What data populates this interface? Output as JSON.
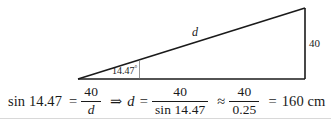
{
  "figure": {
    "type": "right-triangle-diagram",
    "hypotenuse_label": "d",
    "opposite_side_label": "40",
    "angle_label": "14.47",
    "angle_degree_symbol": "°",
    "stroke_color": "#1a1a1a",
    "background_color": "#ffffff",
    "vertices": {
      "left": [
        78,
        79
      ],
      "top_right": [
        305,
        8
      ],
      "bottom_right": [
        305,
        79
      ]
    }
  },
  "equation": {
    "lhs_function": "sin 14.47",
    "equals_1": "=",
    "fraction_1": {
      "numerator": "40",
      "denominator": "d"
    },
    "implies": "⇒",
    "variable": "d",
    "equals_2": "=",
    "fraction_2": {
      "numerator": "40",
      "denominator": "sin 14.47"
    },
    "approx": "≈",
    "fraction_3": {
      "numerator": "40",
      "denominator": "0.25"
    },
    "equals_3": "=",
    "result": "160 cm"
  }
}
